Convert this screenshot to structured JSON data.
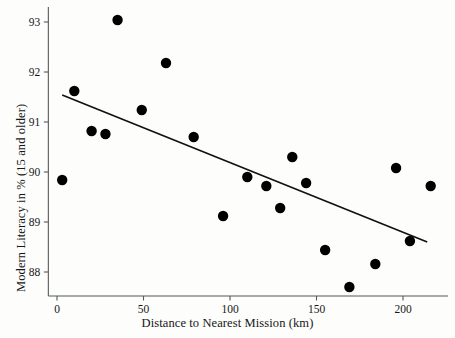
{
  "chart_data": {
    "type": "scatter",
    "title": "",
    "xlabel": "Distance to Nearest Mission (km)",
    "ylabel": "Modern Literacy in % (15 and older)",
    "xlim": [
      -5,
      226
    ],
    "ylim": [
      87.5,
      93.3
    ],
    "xticks": [
      0,
      50,
      100,
      150,
      200
    ],
    "xtick_labels": [
      "0",
      "50",
      "100",
      "150",
      "200"
    ],
    "yticks": [
      88,
      89,
      90,
      91,
      92,
      93
    ],
    "ytick_labels": [
      "88",
      "89",
      "90",
      "91",
      "92",
      "93"
    ],
    "grid": false,
    "legend": null,
    "marker_color": "#000000",
    "marker_size": 5.2,
    "line_color": "#111111",
    "points": [
      {
        "x": 3,
        "y": 89.84
      },
      {
        "x": 10,
        "y": 91.62
      },
      {
        "x": 20,
        "y": 90.82
      },
      {
        "x": 28,
        "y": 90.76
      },
      {
        "x": 35,
        "y": 93.04
      },
      {
        "x": 49,
        "y": 91.24
      },
      {
        "x": 63,
        "y": 92.18
      },
      {
        "x": 79,
        "y": 90.7
      },
      {
        "x": 96,
        "y": 89.12
      },
      {
        "x": 110,
        "y": 89.9
      },
      {
        "x": 121,
        "y": 89.72
      },
      {
        "x": 129,
        "y": 89.28
      },
      {
        "x": 136,
        "y": 90.3
      },
      {
        "x": 144,
        "y": 89.78
      },
      {
        "x": 155,
        "y": 88.44
      },
      {
        "x": 169,
        "y": 87.7
      },
      {
        "x": 184,
        "y": 88.16
      },
      {
        "x": 196,
        "y": 90.08
      },
      {
        "x": 204,
        "y": 88.62
      },
      {
        "x": 216,
        "y": 89.72
      }
    ],
    "fit_line": {
      "type": "linear-fit",
      "x_start": 3,
      "y_start": 91.54,
      "x_end": 214,
      "y_end": 88.6
    }
  }
}
